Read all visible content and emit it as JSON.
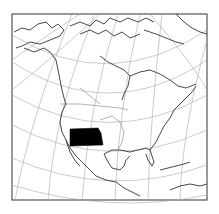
{
  "map": {
    "title": "",
    "region": "North America",
    "highlighted_region": "Kansas (shaded)",
    "highlight_color": "#000000",
    "line_color": "#333333",
    "graticule_color": "#9a9a9a",
    "background_color": "#ffffff",
    "labels": []
  }
}
